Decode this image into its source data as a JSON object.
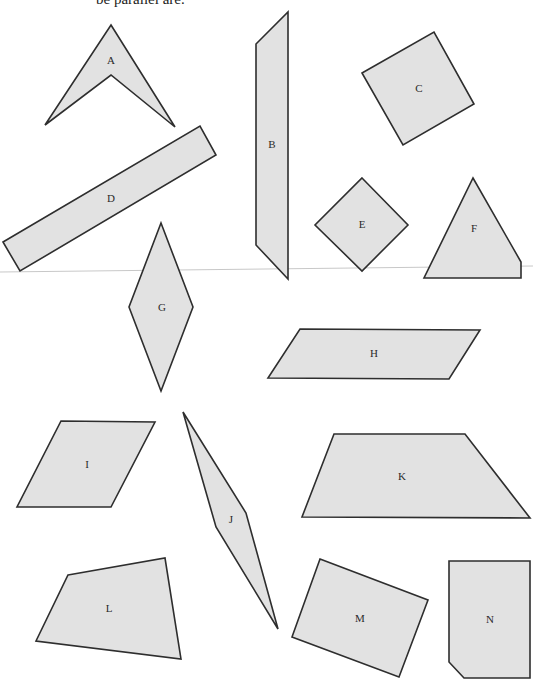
{
  "caption": "be parallel are.",
  "colors": {
    "fill": "#e2e2e2",
    "stroke": "#2e2e2e",
    "label": "#2a2a2a"
  },
  "shapes": [
    {
      "label": "A",
      "kind": "arrowhead"
    },
    {
      "label": "B",
      "kind": "parallelogram"
    },
    {
      "label": "C",
      "kind": "square"
    },
    {
      "label": "D",
      "kind": "rectangle"
    },
    {
      "label": "E",
      "kind": "square"
    },
    {
      "label": "F",
      "kind": "pentagon"
    },
    {
      "label": "G",
      "kind": "rhombus"
    },
    {
      "label": "H",
      "kind": "parallelogram"
    },
    {
      "label": "I",
      "kind": "parallelogram"
    },
    {
      "label": "J",
      "kind": "kite"
    },
    {
      "label": "K",
      "kind": "trapezoid"
    },
    {
      "label": "L",
      "kind": "quadrilateral"
    },
    {
      "label": "M",
      "kind": "rectangle"
    },
    {
      "label": "N",
      "kind": "pentagon"
    }
  ]
}
